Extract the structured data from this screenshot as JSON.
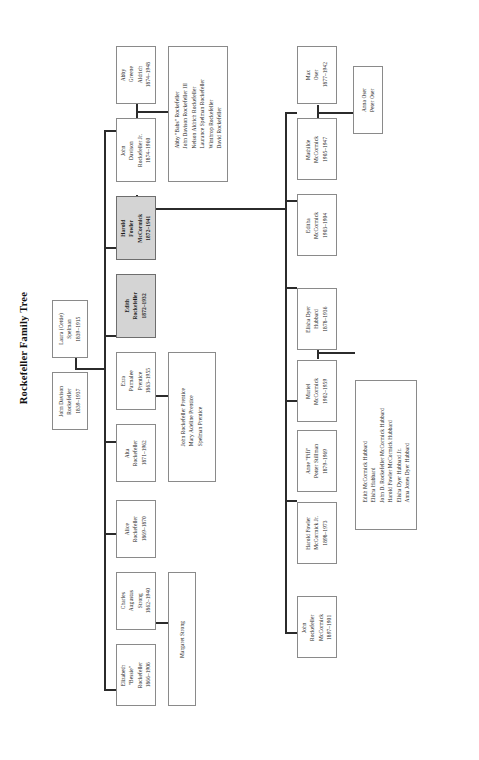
{
  "title": "Rockefeller Family Tree",
  "colors": {
    "highlight_fill": "#d4d4d4",
    "box_border": "#8a8a8a",
    "connector": "#2b2b2b",
    "background": "#ffffff"
  },
  "nodes": {
    "laura_spelman": {
      "name": "Laura (Cettie)\nSpelman",
      "line1": "Laura (Cettie)",
      "line2": "Spelman",
      "dates": "1839–1915",
      "highlight": false
    },
    "john_d_rockefeller": {
      "line1": "John Davison",
      "line2": "Rockefeller",
      "dates": "1839–1937",
      "highlight": false
    },
    "abby_aldrich": {
      "line1": "Abby",
      "line2": "Greene",
      "line3": "Aldrich",
      "dates": "1874–1948",
      "highlight": false
    },
    "jdr_jr": {
      "line1": "John",
      "line2": "Davison",
      "line3": "Rockefeller Jr.",
      "dates": "1874–1960",
      "highlight": false
    },
    "jdr_jr_children": {
      "children": [
        "Abby \"Babs\" Rockefeller",
        "John Davison Rockefeller III",
        "Nelson Aldrich Rockefeller",
        "Laurance Spelman Rockefeller",
        "Winthrop Rockefeller",
        "David Rockefeller"
      ]
    },
    "harold_fowler_mccormick": {
      "line1": "Harold",
      "line2": "Fowler",
      "line3": "McCormick",
      "dates": "1872–1941",
      "highlight": true
    },
    "edith_rockefeller": {
      "line1": "Edith",
      "line2": "Rockefeller",
      "dates": "1872–1932",
      "highlight": true
    },
    "ezra_prentice": {
      "line1": "Ezra",
      "line2": "Parmalee",
      "line3": "Prentice",
      "dates": "1863–1955",
      "highlight": false
    },
    "alta_rockefeller": {
      "line1": "Alta",
      "line2": "Rockefeller",
      "dates": "1871–1962",
      "highlight": false
    },
    "prentice_children": {
      "children": [
        "John Rockefeller Prentice",
        "Mary Adeline Prentice",
        "Spelman Prentice"
      ]
    },
    "alice_rockefeller": {
      "line1": "Alice",
      "line2": "Rockefeller",
      "dates": "1869–1870",
      "highlight": false
    },
    "charles_strong": {
      "line1": "Charles",
      "line2": "Augustus",
      "line3": "Strong",
      "dates": "1862–1940",
      "highlight": false
    },
    "elizabeth_rockefeller": {
      "line1": "Elizabeth",
      "line2": "\"Bessie\"",
      "line3": "Rockefeller",
      "dates": "1866–1906",
      "highlight": false
    },
    "margaret_strong": {
      "line1": "Margaret Strong",
      "highlight": false
    },
    "max_oser": {
      "line1": "Max",
      "line2": "Oser",
      "dates": "1877–1942",
      "highlight": false
    },
    "mathilde_mccormick": {
      "line1": "Mathilde",
      "line2": "McCormick",
      "dates": "1905–1947",
      "highlight": false
    },
    "oser_children": {
      "children": [
        "Anna Oser",
        "Peter Oser"
      ]
    },
    "editha_mccormick": {
      "line1": "Editha",
      "line2": "McCormick",
      "dates": "1903–1904",
      "highlight": false
    },
    "elisha_hubbard": {
      "line1": "Elisha Dyer",
      "line2": "Hubbard",
      "dates": "1878–1936",
      "highlight": false
    },
    "muriel_mccormick": {
      "line1": "Muriel",
      "line2": "McCormick",
      "dates": "1902–1959",
      "highlight": false
    },
    "hubbard_children": {
      "children": [
        "Edith McCormick Hubbard",
        "Elisha Hubbard",
        "John D. Rockefeller McCormick Hubbard",
        "Harold Fowler McCormick Hubbard",
        "Elisha Dyer Hubbard Jr.",
        "Anna Jones Dyer Hubbard"
      ]
    },
    "anne_stillman": {
      "line1": "Anne \"Fifi\"",
      "line2": "Potter Stillman",
      "dates": "1879–1969",
      "highlight": false
    },
    "harold_jr": {
      "line1": "Harold Fowler",
      "line2": "McCormick Jr.",
      "dates": "1898–1973",
      "highlight": false
    },
    "john_r_mccormick": {
      "line1": "John",
      "line2": "Rockefeller",
      "line3": "McCormick",
      "dates": "1897–1901",
      "highlight": false
    }
  }
}
